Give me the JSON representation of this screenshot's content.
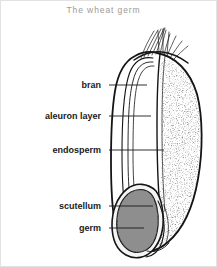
{
  "figure": {
    "title": "The wheat germ",
    "title_color": "#9a9a9a",
    "border_color": "#e2e2e2",
    "background": "#ffffff"
  },
  "labels": [
    {
      "id": "bran",
      "text": "bran",
      "text_right_x": 102,
      "text_y": 85,
      "leader_x1": 108,
      "leader_x2": 146,
      "leader_y": 84
    },
    {
      "id": "aleuron-layer",
      "text": "aleuron layer",
      "text_right_x": 102,
      "text_y": 116,
      "leader_x1": 108,
      "leader_x2": 150,
      "leader_y": 115
    },
    {
      "id": "endosperm",
      "text": "endosperm",
      "text_right_x": 102,
      "text_y": 150,
      "leader_x1": 108,
      "leader_x2": 163,
      "leader_y": 149
    },
    {
      "id": "scutellum",
      "text": "scutellum",
      "text_right_x": 102,
      "text_y": 206,
      "leader_x1": 108,
      "leader_x2": 152,
      "leader_y": 205
    },
    {
      "id": "germ",
      "text": "germ",
      "text_right_x": 102,
      "text_y": 228,
      "leader_x1": 108,
      "leader_x2": 143,
      "leader_y": 227
    }
  ],
  "diagram": {
    "name": "wheat-grain-cross-section",
    "ink_color": "#151515",
    "endosperm_fill": "#ffffff",
    "endosperm_stipple_color": "#3a3a3a",
    "germ_fill": "#8d8d8d",
    "germ_speckle_color": "#4a4a4a",
    "scutellum_fill": "#f2f2f2",
    "parts": [
      {
        "name": "brush-hairs",
        "description": "fine hair tuft at the apex of the grain"
      },
      {
        "name": "pericarp-bran",
        "description": "outer concentric layered coats on the left flank"
      },
      {
        "name": "aleuron-layer",
        "description": "thin inner coat just inside the bran"
      },
      {
        "name": "endosperm",
        "description": "large stippled starchy body filling the right and centre"
      },
      {
        "name": "scutellum",
        "description": "pale shield-shaped layer between germ and endosperm"
      },
      {
        "name": "germ",
        "description": "dark granular embryo mass at the lower left"
      }
    ]
  }
}
